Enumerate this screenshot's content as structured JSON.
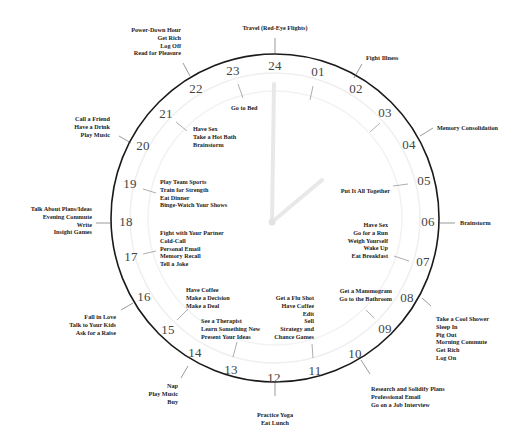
{
  "clock": {
    "hours": [
      "24",
      "01",
      "02",
      "03",
      "04",
      "05",
      "06",
      "07",
      "08",
      "09",
      "10",
      "11",
      "12",
      "13",
      "14",
      "15",
      "16",
      "17",
      "18",
      "19",
      "20",
      "21",
      "22",
      "23"
    ],
    "colors": {
      "outer_ring": "#1a1a1a",
      "inner_ring": "#eeeeee",
      "hands": "#e6e6e6",
      "text": "#222222"
    }
  },
  "activities": {
    "outer": {
      "h24": [
        "Travel (Red-Eye Flights)"
      ],
      "h02": [
        "Fight Illness"
      ],
      "h04": [
        "Memory Consolidation"
      ],
      "h06": [
        "Brainstorm"
      ],
      "h08": [
        "Take a Cool Shower",
        "Sleep In",
        "Pig Out",
        "Morning Commute",
        "Get Rich",
        "Log On"
      ],
      "h10": [
        "Research and Solidify Plans",
        "Professional Email",
        "Go on a Job Interview"
      ],
      "h12": [
        "Practice Yoga",
        "Eat Lunch"
      ],
      "h14": [
        "Nap",
        "Play Music",
        "Buy"
      ],
      "h16": [
        "Fall in Love",
        "Talk to Your Kids",
        "Ask for a Raise"
      ],
      "h18": [
        "Talk About Plans/Ideas",
        "Evening Commute",
        "Write",
        "Insight Games"
      ],
      "h20": [
        "Call a Friend",
        "Have a Drink",
        "Play Music"
      ],
      "h22": [
        "Power-Down Hour",
        "Get Rich",
        "Log Off",
        "Read for Pleasure"
      ]
    },
    "inner": {
      "h23": [
        "Go to Bed"
      ],
      "h21": [
        "Have Sex",
        "Take a Hot Bath",
        "Brainstorm"
      ],
      "h19": [
        "Play Team Sports",
        "Train for Strength",
        "Eat Dinner",
        "Binge-Watch Your Shows"
      ],
      "h17": [
        "Fight with Your Partner",
        "Cold-Call",
        "Personal Email",
        "Memory Recall",
        "Tell a Joke"
      ],
      "h15": [
        "Have Coffee",
        "Make a Decision",
        "Make a Deal"
      ],
      "h13": [
        "See a Therapist",
        "Learn Something New",
        "Present Your Ideas"
      ],
      "h11": [
        "Get a Flu Shot",
        "Have Coffee",
        "Edit",
        "Sell",
        "Strategy and",
        "Chance Games"
      ],
      "h09": [
        "Get a Mammogram",
        "Go to the Bathroom"
      ],
      "h07": [
        "Have Sex",
        "Go for a Run",
        "Weigh Yourself",
        "Wake Up",
        "Eat Breakfast"
      ],
      "h05": [
        "Put It All Together"
      ]
    }
  }
}
